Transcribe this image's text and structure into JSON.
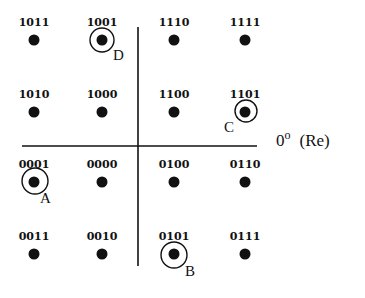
{
  "diagram": {
    "type": "16-QAM constellation",
    "axis_label": "0° (Re)",
    "axis_label_parts": {
      "angle": "0",
      "degree": "o",
      "name": "(Re)"
    },
    "colors": {
      "ink": "#111111",
      "background": "#ffffff"
    },
    "axes": {
      "horizontal": {
        "x1": 22,
        "x2": 257,
        "y": 146
      },
      "vertical": {
        "x": 138,
        "y1": 27,
        "y2": 266
      }
    },
    "points": [
      {
        "code": "1011",
        "x": 34,
        "y": 40
      },
      {
        "code": "1001",
        "x": 102,
        "y": 40
      },
      {
        "code": "1110",
        "x": 174,
        "y": 40
      },
      {
        "code": "1111",
        "x": 245,
        "y": 40
      },
      {
        "code": "1010",
        "x": 34,
        "y": 112
      },
      {
        "code": "1000",
        "x": 102,
        "y": 112
      },
      {
        "code": "1100",
        "x": 174,
        "y": 112
      },
      {
        "code": "1101",
        "x": 245,
        "y": 112
      },
      {
        "code": "0001",
        "x": 34,
        "y": 182
      },
      {
        "code": "0000",
        "x": 102,
        "y": 182
      },
      {
        "code": "0100",
        "x": 174,
        "y": 182
      },
      {
        "code": "0110",
        "x": 245,
        "y": 182
      },
      {
        "code": "0011",
        "x": 34,
        "y": 254
      },
      {
        "code": "0010",
        "x": 102,
        "y": 254
      },
      {
        "code": "0101",
        "x": 174,
        "y": 254
      },
      {
        "code": "0111",
        "x": 245,
        "y": 254
      }
    ],
    "markers": [
      {
        "letter": "A",
        "code": "0001",
        "cx": 35,
        "cy": 181,
        "r": 13,
        "lx": 40,
        "ly": 203
      },
      {
        "letter": "B",
        "code": "0101",
        "cx": 174,
        "cy": 255,
        "r": 13,
        "lx": 185,
        "ly": 276
      },
      {
        "letter": "C",
        "code": "1101",
        "cx": 246,
        "cy": 111,
        "r": 11,
        "lx": 224,
        "ly": 132
      },
      {
        "letter": "D",
        "code": "1001",
        "cx": 102,
        "cy": 40,
        "r": 12,
        "lx": 113,
        "ly": 60
      }
    ]
  }
}
